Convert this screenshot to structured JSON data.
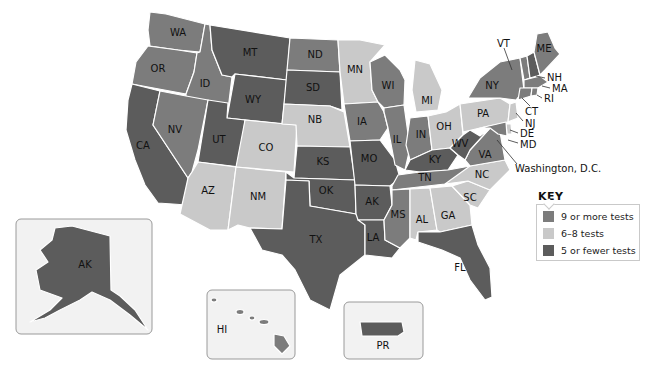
{
  "colors": {
    "high": "#7c7c7c",
    "mid": "#c9c9c9",
    "low": "#5c5c5c"
  },
  "legend": {
    "title": "KEY",
    "items": [
      {
        "label": "9 or more tests",
        "category": "high"
      },
      {
        "label": "6–8 tests",
        "category": "mid"
      },
      {
        "label": "5 or fewer tests",
        "category": "low"
      }
    ]
  },
  "states": [
    {
      "abbr": "WA",
      "category": "high"
    },
    {
      "abbr": "OR",
      "category": "high"
    },
    {
      "abbr": "CA",
      "category": "low"
    },
    {
      "abbr": "ID",
      "category": "high"
    },
    {
      "abbr": "NV",
      "category": "high"
    },
    {
      "abbr": "MT",
      "category": "low"
    },
    {
      "abbr": "WY",
      "category": "low"
    },
    {
      "abbr": "UT",
      "category": "low"
    },
    {
      "abbr": "AZ",
      "category": "mid"
    },
    {
      "abbr": "CO",
      "category": "mid"
    },
    {
      "abbr": "NM",
      "category": "mid"
    },
    {
      "abbr": "ND",
      "category": "high"
    },
    {
      "abbr": "SD",
      "category": "low"
    },
    {
      "abbr": "NB",
      "category": "mid"
    },
    {
      "abbr": "KS",
      "category": "low"
    },
    {
      "abbr": "OK",
      "category": "low"
    },
    {
      "abbr": "TX",
      "category": "low"
    },
    {
      "abbr": "MN",
      "category": "mid"
    },
    {
      "abbr": "IA",
      "category": "high"
    },
    {
      "abbr": "MO",
      "category": "low"
    },
    {
      "abbr": "AK",
      "category": "low",
      "note": "Arkansas"
    },
    {
      "abbr": "LA",
      "category": "low"
    },
    {
      "abbr": "WI",
      "category": "high"
    },
    {
      "abbr": "IL",
      "category": "high"
    },
    {
      "abbr": "MI",
      "category": "mid"
    },
    {
      "abbr": "IN",
      "category": "high"
    },
    {
      "abbr": "OH",
      "category": "mid"
    },
    {
      "abbr": "KY",
      "category": "low"
    },
    {
      "abbr": "TN",
      "category": "high"
    },
    {
      "abbr": "MS",
      "category": "high"
    },
    {
      "abbr": "AL",
      "category": "mid"
    },
    {
      "abbr": "GA",
      "category": "mid"
    },
    {
      "abbr": "FL",
      "category": "low"
    },
    {
      "abbr": "SC",
      "category": "mid"
    },
    {
      "abbr": "NC",
      "category": "mid"
    },
    {
      "abbr": "VA",
      "category": "high"
    },
    {
      "abbr": "WV",
      "category": "low"
    },
    {
      "abbr": "PA",
      "category": "mid"
    },
    {
      "abbr": "NY",
      "category": "high"
    },
    {
      "abbr": "VT",
      "category": "high"
    },
    {
      "abbr": "NH",
      "category": "low"
    },
    {
      "abbr": "ME",
      "category": "high"
    },
    {
      "abbr": "MA",
      "category": "high"
    },
    {
      "abbr": "RI",
      "category": "high"
    },
    {
      "abbr": "CT",
      "category": "high"
    },
    {
      "abbr": "NJ",
      "category": "mid"
    },
    {
      "abbr": "DE",
      "category": "mid"
    },
    {
      "abbr": "MD",
      "category": "high"
    },
    {
      "abbr": "Washington, D.C.",
      "category": "high"
    }
  ],
  "insets": [
    {
      "abbr": "AK",
      "category": "low",
      "note": "Alaska"
    },
    {
      "abbr": "HI",
      "category": "high"
    },
    {
      "abbr": "PR",
      "category": "low"
    }
  ],
  "callouts": [
    "VT",
    "NH",
    "MA",
    "RI",
    "CT",
    "NJ",
    "DE",
    "MD",
    "Washington, D.C."
  ]
}
